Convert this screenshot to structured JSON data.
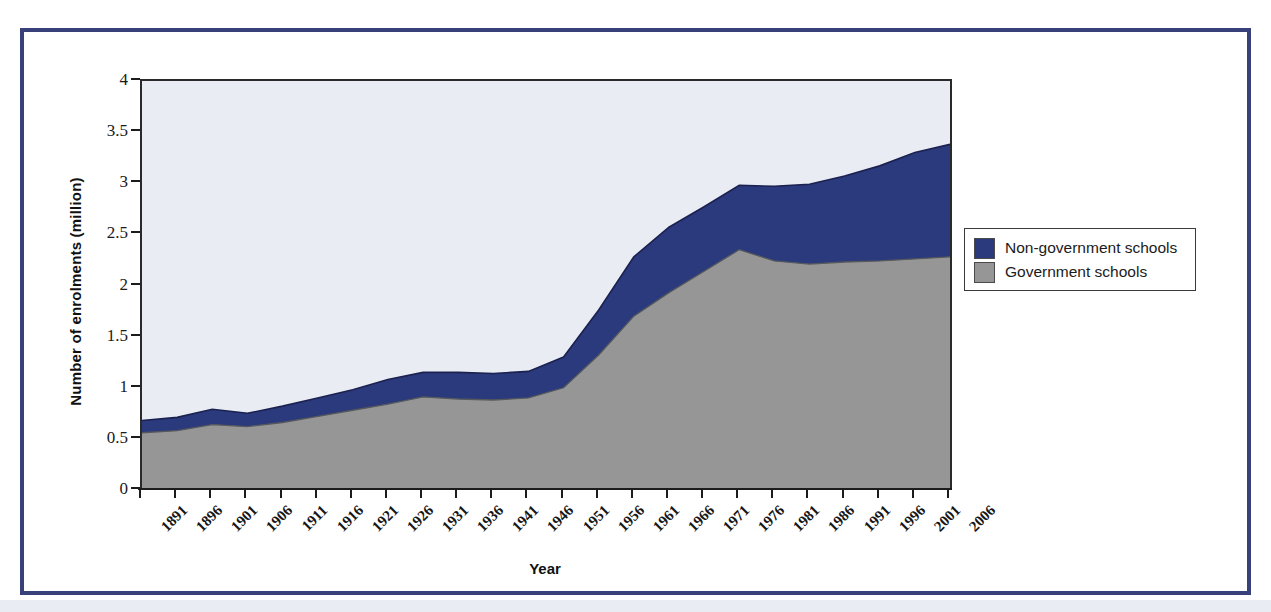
{
  "figure": {
    "frame_color": "#39417a",
    "plot_background": "#e9edf3"
  },
  "legend": {
    "position": "right",
    "items": [
      {
        "label": "Non-government schools",
        "color": "#2b3a7c"
      },
      {
        "label": "Government schools",
        "color": "#969696"
      }
    ]
  },
  "chart_data": {
    "type": "area",
    "stacked": true,
    "title": "",
    "subtitle": "",
    "xlabel": "Year",
    "ylabel": "Number of enrolments (million)",
    "xlim": [
      1891,
      2006
    ],
    "ylim": [
      0,
      4
    ],
    "yticks": [
      0,
      0.5,
      1,
      1.5,
      2,
      2.5,
      3,
      3.5,
      4
    ],
    "ytick_labels": [
      "0",
      "0.5",
      "1",
      "1.5",
      "2",
      "2.5",
      "3",
      "3.5",
      "4"
    ],
    "grid": false,
    "legend_position": "right",
    "categories": [
      1891,
      1896,
      1901,
      1906,
      1911,
      1916,
      1921,
      1926,
      1931,
      1936,
      1941,
      1946,
      1951,
      1956,
      1961,
      1966,
      1971,
      1976,
      1981,
      1986,
      1991,
      1996,
      2001,
      2006
    ],
    "x": [
      1891,
      1896,
      1901,
      1906,
      1911,
      1916,
      1921,
      1926,
      1931,
      1936,
      1941,
      1946,
      1951,
      1956,
      1961,
      1966,
      1971,
      1976,
      1981,
      1986,
      1991,
      1996,
      2001,
      2006
    ],
    "series": [
      {
        "name": "Government schools",
        "color": "#969696",
        "values": [
          0.56,
          0.58,
          0.64,
          0.62,
          0.66,
          0.72,
          0.78,
          0.84,
          0.91,
          0.89,
          0.88,
          0.9,
          1.0,
          1.32,
          1.7,
          1.93,
          2.14,
          2.35,
          2.24,
          2.21,
          2.23,
          2.24,
          2.26,
          2.28
        ]
      },
      {
        "name": "Non-government schools",
        "color": "#2b3a7c",
        "values": [
          0.12,
          0.13,
          0.15,
          0.13,
          0.16,
          0.18,
          0.2,
          0.24,
          0.24,
          0.26,
          0.26,
          0.26,
          0.3,
          0.44,
          0.58,
          0.64,
          0.63,
          0.63,
          0.73,
          0.78,
          0.84,
          0.93,
          1.04,
          1.1
        ]
      }
    ],
    "totals": [
      0.68,
      0.71,
      0.79,
      0.75,
      0.82,
      0.9,
      0.98,
      1.08,
      1.15,
      1.15,
      1.14,
      1.16,
      1.3,
      1.76,
      2.28,
      2.57,
      2.77,
      2.98,
      2.97,
      2.99,
      3.07,
      3.17,
      3.3,
      3.38
    ]
  }
}
